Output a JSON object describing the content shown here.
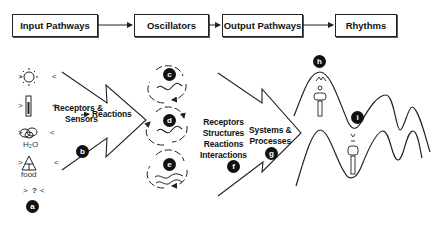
{
  "flow": {
    "boxes": [
      {
        "label": "Input Pathways"
      },
      {
        "label": "Oscillators"
      },
      {
        "label": "Output Pathways"
      },
      {
        "label": "Rhythms"
      }
    ]
  },
  "input_stimuli": {
    "items": [
      {
        "icon": "sun-icon",
        "caption": ""
      },
      {
        "icon": "thermometer-icon",
        "caption": ""
      },
      {
        "icon": "water-drops-icon",
        "caption": "H₂O"
      },
      {
        "icon": "food-pyramid-icon",
        "caption": "food"
      },
      {
        "icon": "unknown-icon",
        "caption": "?"
      }
    ],
    "bracket_left": ">",
    "bracket_right": "<"
  },
  "labels": {
    "receptors_sensors": [
      "Receptors &",
      "Sensors"
    ],
    "reactions": "Reactions",
    "output_list": [
      "Receptors",
      "Structures",
      "Reactions",
      "Interactions"
    ],
    "systems_processes": [
      "Systems &",
      "Processes"
    ]
  },
  "badges": {
    "a": "a",
    "b": "b",
    "c": "c",
    "d": "d",
    "e": "e",
    "f": "f",
    "g": "g",
    "h": "h",
    "i": "i"
  }
}
